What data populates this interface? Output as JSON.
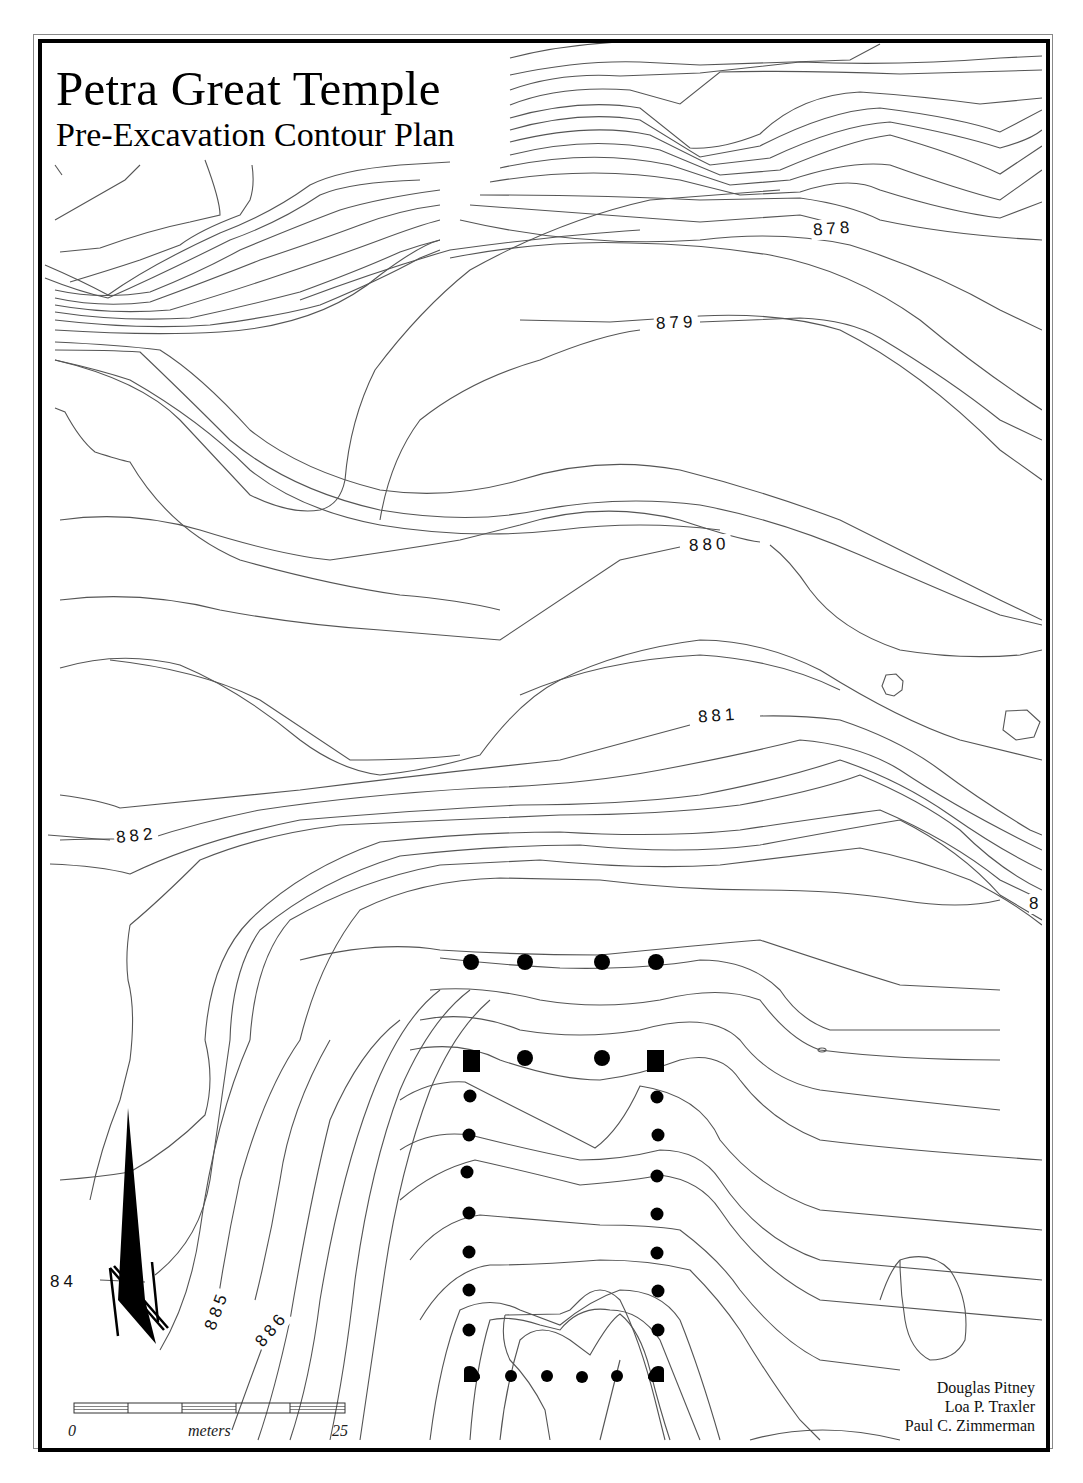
{
  "map": {
    "title": "Petra Great Temple",
    "subtitle": "Pre-Excavation Contour Plan",
    "contour_labels": [
      {
        "id": "878",
        "text": "878"
      },
      {
        "id": "879",
        "text": "879"
      },
      {
        "id": "880",
        "text": "880"
      },
      {
        "id": "881",
        "text": "881"
      },
      {
        "id": "882",
        "text": "882"
      },
      {
        "id": "883",
        "text": "8"
      },
      {
        "id": "884",
        "text": "84"
      },
      {
        "id": "885",
        "text": "885"
      },
      {
        "id": "886",
        "text": "886"
      }
    ],
    "scale_bar": {
      "start": "0",
      "unit": "meters",
      "end": "25"
    },
    "north_arrow": "north-arrow",
    "credits": [
      "Douglas Pitney",
      "Loa P. Traxler",
      "Paul C. Zimmerman"
    ],
    "colors": {
      "ink": "#000000",
      "contour": "#555555",
      "paper": "#ffffff"
    }
  }
}
